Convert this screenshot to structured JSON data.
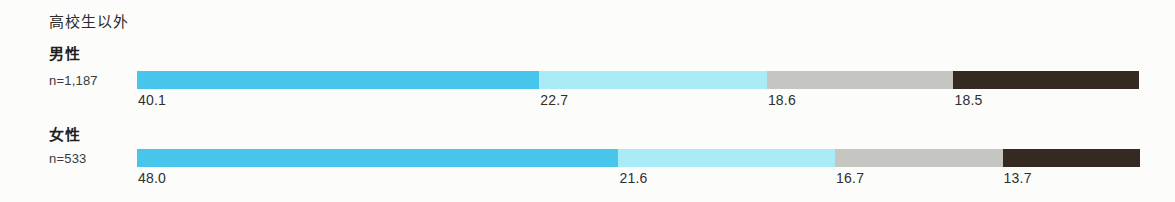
{
  "page": {
    "title": "高校生以外"
  },
  "chart_data": {
    "type": "bar",
    "orientation": "horizontal",
    "stacked": true,
    "percent_total": true,
    "title": "高校生以外",
    "unit": "%",
    "xlim": [
      0,
      100
    ],
    "categories": [
      "男性",
      "女性"
    ],
    "rows": [
      {
        "label": "男性",
        "n_label": "n=1,187",
        "values": [
          40.1,
          22.7,
          18.6,
          18.5
        ],
        "value_labels": [
          "40.1",
          "22.7",
          "18.6",
          "18.5"
        ]
      },
      {
        "label": "女性",
        "n_label": "n=533",
        "values": [
          48.0,
          21.6,
          16.7,
          13.7
        ],
        "value_labels": [
          "48.0",
          "21.6",
          "16.7",
          "13.7"
        ]
      }
    ],
    "segment_colors": [
      "#47c5ea",
      "#a9ecf7",
      "#c5c5c2",
      "#342a22"
    ],
    "legend": "none",
    "value_labels_position": "below bar, left-aligned with segment start",
    "grid": false
  }
}
